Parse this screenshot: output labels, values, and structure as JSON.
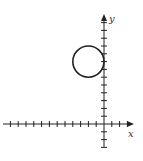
{
  "figure": {
    "type": "coordinate-plane",
    "x_axis_label": "x",
    "y_axis_label": "y",
    "tick_spacing_units": 1,
    "x_range": [
      -12,
      3
    ],
    "y_range": [
      -3,
      13
    ],
    "colors": {
      "stroke": "#222222",
      "background": "#ffffff"
    }
  },
  "chart_data": {
    "type": "scatter",
    "title": "",
    "xlabel": "x",
    "ylabel": "y",
    "xlim": [
      -12.5,
      3.5
    ],
    "ylim": [
      -3,
      14
    ],
    "grid": false,
    "shapes": [
      {
        "kind": "circle",
        "center": [
          -2,
          8
        ],
        "radius": 2
      }
    ]
  }
}
